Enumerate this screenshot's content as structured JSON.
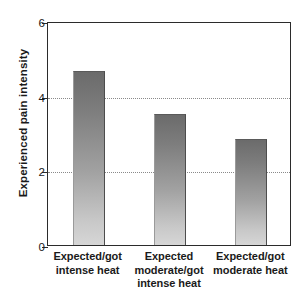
{
  "chart_data": {
    "type": "bar",
    "title": "",
    "subtitle": "",
    "xlabel": "",
    "ylabel": "Experienced pain intensity",
    "ylim": [
      0,
      6
    ],
    "yticks": [
      0,
      2,
      4,
      6
    ],
    "ytick_labels": [
      "0",
      "2",
      "4",
      "6"
    ],
    "grid": "horizontal-dotted-at-2-and-4",
    "gridlines": [
      2,
      4
    ],
    "legend": "none",
    "categories": [
      "Expected/got intense heat",
      "Expected moderate/got intense heat",
      "Expected/got moderate heat"
    ],
    "category_lines": [
      [
        "Expected/got",
        "intense heat"
      ],
      [
        "Expected",
        "moderate/got",
        "intense heat"
      ],
      [
        "Expected/got",
        "moderate heat"
      ]
    ],
    "values": [
      4.65,
      3.5,
      2.85
    ],
    "bar_fill_top_color": "#6b6b6b",
    "bar_fill_bottom_color": "#d6d6d6",
    "axis_color": "#2b2b2b",
    "gridline_color": "#8a8a8a"
  }
}
